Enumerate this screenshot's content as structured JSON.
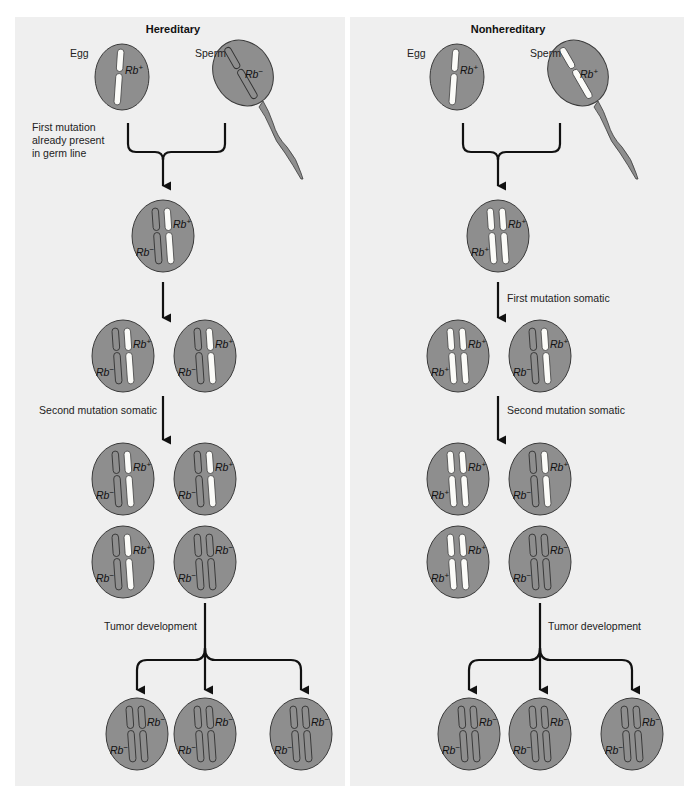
{
  "panels": [
    {
      "id": "hereditary",
      "title": "Hereditary",
      "egg_label": "Egg",
      "sperm_label": "Sperm",
      "egg_allele": "+",
      "sperm_allele": "−",
      "fusion_note": [
        "First mutation",
        "already present",
        "in germ line"
      ],
      "zygote": [
        "−",
        "+"
      ],
      "step1_note": "",
      "row1": [
        [
          "−",
          "+"
        ],
        [
          "−",
          "+"
        ]
      ],
      "step2_note": "Second mutation somatic",
      "row2": [
        [
          "−",
          "+"
        ],
        [
          "−",
          "+"
        ]
      ],
      "row3": [
        [
          "−",
          "+"
        ],
        [
          "−",
          "−"
        ]
      ],
      "step3_note": "Tumor development",
      "tumor": [
        [
          "−",
          "−"
        ],
        [
          "−",
          "−"
        ],
        [
          "−",
          "−"
        ]
      ]
    },
    {
      "id": "nonhereditary",
      "title": "Nonhereditary",
      "egg_label": "Egg",
      "sperm_label": "Sperm",
      "egg_allele": "+",
      "sperm_allele": "+",
      "fusion_note": [],
      "zygote": [
        "+",
        "+"
      ],
      "step1_note": "First mutation somatic",
      "row1": [
        [
          "+",
          "+"
        ],
        [
          "−",
          "+"
        ]
      ],
      "step2_note": "Second mutation somatic",
      "row2": [
        [
          "+",
          "+"
        ],
        [
          "−",
          "+"
        ]
      ],
      "row3": [
        [
          "+",
          "+"
        ],
        [
          "−",
          "−"
        ]
      ],
      "step3_note": "Tumor development",
      "tumor": [
        [
          "−",
          "−"
        ],
        [
          "−",
          "−"
        ],
        [
          "−",
          "−"
        ]
      ]
    }
  ],
  "gene_symbol": "Rb",
  "colors": {
    "panel_bg": "#efefef",
    "cell_fill": "#8e8e8e",
    "wild_type_chromosome": "#fbfbf8",
    "mutant_chromosome": "#8e8e8e"
  }
}
